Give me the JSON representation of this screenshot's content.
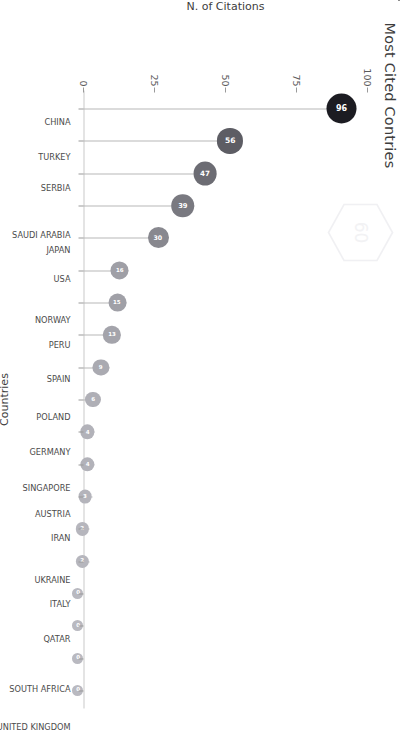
{
  "figure": {
    "title": "Most Cited Contries",
    "watermark_icon": "hexagon-logo-watermark"
  },
  "chart_data": {
    "type": "bar",
    "subtype": "lollipop",
    "orientation": "vertical-rotated-90ccw",
    "title": "Most Cited Contries",
    "xlabel": "Countries",
    "ylabel": "N. of Citations",
    "categories": [
      "CHINA",
      "TURKEY",
      "SERBIA",
      "SAUDI ARABIA",
      "JAPAN",
      "USA",
      "NORWAY",
      "PERU",
      "SPAIN",
      "POLAND",
      "GERMANY",
      "SINGAPORE",
      "AUSTRIA",
      "IRAN",
      "UKRAINE",
      "ITALY",
      "QATAR",
      "SOUTH AFRICA",
      "UNITED KINGDOM"
    ],
    "values": [
      96,
      56,
      47,
      39,
      30,
      16,
      15,
      13,
      9,
      6,
      4,
      4,
      3,
      2,
      2,
      0,
      0,
      0,
      0
    ],
    "ylim": [
      0,
      100
    ],
    "yticks": [
      0,
      25,
      50,
      75,
      100
    ],
    "ytick_labels": [
      "0",
      "25",
      "50",
      "75",
      "100"
    ],
    "grid": false,
    "legend": false,
    "colors": {
      "max": "#1c1c22",
      "min": "#b9b9c0",
      "stem": "#b7b7b7",
      "axis": "#c9c9c9",
      "text": "#4b4b4b",
      "title": "#3d3d3d",
      "label_fill": "#ffffff"
    },
    "point_labels": [
      "96",
      "56",
      "47",
      "39",
      "30",
      "16",
      "15",
      "13",
      "9",
      "6",
      "4",
      "4",
      "3",
      "2",
      "2",
      "0",
      "0",
      "0",
      "0"
    ]
  }
}
